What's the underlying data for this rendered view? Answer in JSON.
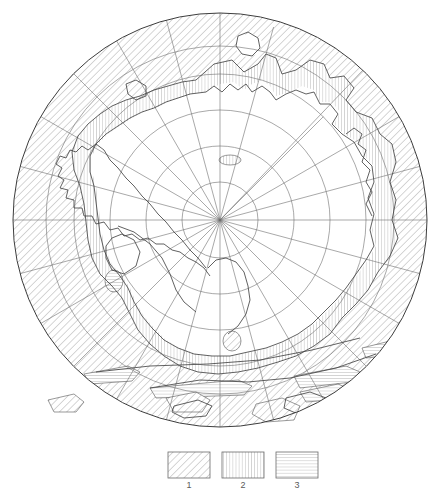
{
  "figure": {
    "kind": "polar-stereographic-map",
    "background_color": "#ffffff",
    "line_color": "#4a4a4a",
    "hatch_color": "#8c8c8c",
    "graticule_color": "#6f6f6f"
  },
  "projection": {
    "center_x": 220,
    "center_y": 220,
    "outer_radius": 207,
    "latitude_circles_radii": [
      38,
      74,
      110,
      146,
      174,
      207
    ],
    "meridian_count": 24,
    "meridian_step_degrees": 15
  },
  "patterns": {
    "1": {
      "name": "diagonal-hatch",
      "angle_degrees": 45,
      "spacing_px": 4
    },
    "2": {
      "name": "vertical-hatch",
      "spacing_px": 3
    },
    "3": {
      "name": "horizontal-hatch",
      "spacing_px": 3
    }
  },
  "legend": {
    "name": "map-legend",
    "items": [
      {
        "id": "1",
        "label": "1",
        "pattern": "diagonal-hatch"
      },
      {
        "id": "2",
        "label": "2",
        "pattern": "vertical-hatch"
      },
      {
        "id": "3",
        "label": "3",
        "pattern": "horizontal-hatch"
      }
    ],
    "swatch_width": 42,
    "swatch_height": 26,
    "swatch_y": 452,
    "swatch_xs": [
      168,
      222,
      276
    ],
    "label_y": 486
  },
  "regions": {
    "zone1_diagonal": "outer ring of ocean / pack-ice beyond the continental shelf, filled with 45-degree diagonal hatching",
    "zone2_vertical": "coastal belt immediately surrounding the continent, filled with vertical hatching",
    "zone3_horizontal": "scattered elongated bands near the lower margin, filled with horizontal hatching",
    "continent_blank": "interior of Antarctica, unhatched white with graticule only"
  }
}
